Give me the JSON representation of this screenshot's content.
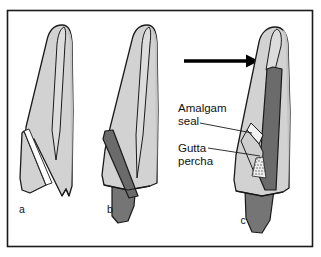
{
  "figure": {
    "domain": "dental-diagram",
    "frame": {
      "x": 7,
      "y": 10,
      "width": 306,
      "height": 237,
      "border_color": "#1a1a1a",
      "background": "#ffffff"
    },
    "panels": [
      {
        "id": "a",
        "letter": "a",
        "letter_x": 22,
        "letter_y": 212,
        "caption": "a"
      },
      {
        "id": "b",
        "letter": "b",
        "letter_x": 110,
        "letter_y": 212,
        "caption": "b"
      },
      {
        "id": "c",
        "letter": "c",
        "letter_x": 243,
        "letter_y": 223,
        "caption": "c"
      }
    ],
    "annotations": [
      {
        "id": "amalgam-seal",
        "line1": "Amalgam",
        "line2": "seal",
        "x": 178,
        "y1": 108,
        "y2": 121
      },
      {
        "id": "gutta-percha",
        "line1": "Gutta",
        "line2": "percha",
        "x": 178,
        "y1": 148,
        "y2": 161
      }
    ],
    "arrow": {
      "x1": 184,
      "y1": 61,
      "x2": 258,
      "y2": 61,
      "color": "#000000"
    },
    "colors": {
      "tooth_light": "#d4d4d4",
      "tooth_mid": "#c2c2c2",
      "tooth_shadow": "#b6b6b6",
      "post_dark": "#6b6b6b",
      "root_dark": "#787878",
      "outline": "#1a1a1a",
      "white": "#ffffff",
      "text": "#111111"
    }
  }
}
